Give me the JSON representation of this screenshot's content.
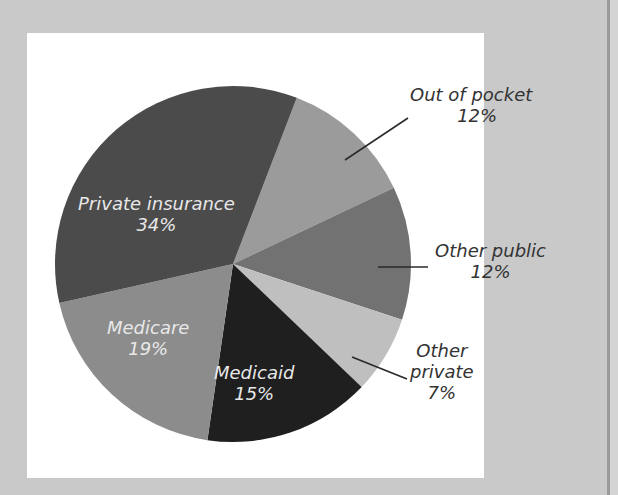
{
  "chart_data": {
    "type": "pie",
    "title": "",
    "slices": [
      {
        "label": "Out of pocket",
        "value": 12,
        "value_label": "12%",
        "color": "#9b9b9b"
      },
      {
        "label": "Other public",
        "value": 12,
        "value_label": "12%",
        "color": "#727272"
      },
      {
        "label": "Other private",
        "value": 7,
        "value_label": "7%",
        "color": "#bfbfbf"
      },
      {
        "label": "Medicaid",
        "value": 15,
        "value_label": "15%",
        "color": "#1f1f1f"
      },
      {
        "label": "Medicare",
        "value": 19,
        "value_label": "19%",
        "color": "#8c8c8c"
      },
      {
        "label": "Private insurance",
        "value": 34,
        "value_label": "34%",
        "color": "#4b4b4b"
      }
    ],
    "start_angle_deg": 21,
    "direction": "clockwise",
    "units": "percent"
  },
  "labels": {
    "out_of_pocket": {
      "name": "Out of pocket",
      "pct": "12%"
    },
    "other_public": {
      "name": "Other public",
      "pct": "12%"
    },
    "other_private": {
      "name_line1": "Other",
      "name_line2": "private",
      "pct": "7%"
    },
    "medicaid": {
      "name": "Medicaid",
      "pct": "15%"
    },
    "medicare": {
      "name": "Medicare",
      "pct": "19%"
    },
    "private_insurance": {
      "name": "Private insurance",
      "pct": "34%"
    }
  }
}
